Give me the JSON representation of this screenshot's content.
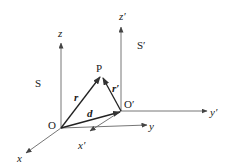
{
  "diagram": {
    "type": "vector-diagram",
    "colors": {
      "line": "#555555",
      "vector": "#222222",
      "text": "#1a1a1a"
    },
    "frames": {
      "S": {
        "label": "S",
        "origin_label": "O",
        "axes": {
          "x": "x",
          "y": "y",
          "z": "z"
        }
      },
      "S_prime": {
        "label": "S′",
        "origin_label": "O′",
        "axes": {
          "x": "x′",
          "y": "y′",
          "z": "z′"
        }
      }
    },
    "point": {
      "label": "P"
    },
    "vectors": {
      "r": {
        "label": "r",
        "from": "O",
        "to": "P"
      },
      "r_prime": {
        "label": "r′",
        "from": "O′",
        "to": "P"
      },
      "d": {
        "label": "d",
        "from": "O",
        "to": "O′"
      }
    }
  }
}
